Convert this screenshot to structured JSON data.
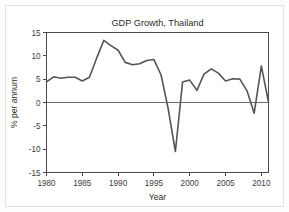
{
  "chart_data": {
    "type": "line",
    "title": "GDP Growth, Thailand",
    "xlabel": "Year",
    "ylabel": "% per annum",
    "xlim": [
      1980,
      2011
    ],
    "ylim": [
      -15,
      15
    ],
    "xticks": [
      1980,
      1985,
      1990,
      1995,
      2000,
      2005,
      2010
    ],
    "xtick_labels": [
      "1980",
      "1985",
      "1990",
      "1995",
      "2000",
      "2005",
      "2010"
    ],
    "yticks": [
      -15,
      -10,
      -5,
      0,
      5,
      10,
      15
    ],
    "ytick_labels": [
      "-15",
      "-10",
      "-5",
      "0",
      "5",
      "10",
      "15"
    ],
    "grid": false,
    "legend": null,
    "zero_line": 0,
    "series": [
      {
        "name": "GDP growth",
        "color": "#555555",
        "x": [
          1980,
          1981,
          1982,
          1983,
          1984,
          1985,
          1986,
          1987,
          1988,
          1989,
          1990,
          1991,
          1992,
          1993,
          1994,
          1995,
          1996,
          1997,
          1998,
          1999,
          2000,
          2001,
          2002,
          2003,
          2004,
          2005,
          2006,
          2007,
          2008,
          2009,
          2010,
          2011
        ],
        "values": [
          4.4,
          5.5,
          5.2,
          5.4,
          5.4,
          4.6,
          5.4,
          9.5,
          13.3,
          12.2,
          11.2,
          8.6,
          8.1,
          8.3,
          9.0,
          9.2,
          5.9,
          -1.4,
          -10.5,
          4.4,
          4.8,
          2.6,
          6.1,
          7.2,
          6.3,
          4.6,
          5.1,
          5.0,
          2.5,
          -2.3,
          7.8,
          0.1
        ]
      }
    ]
  }
}
